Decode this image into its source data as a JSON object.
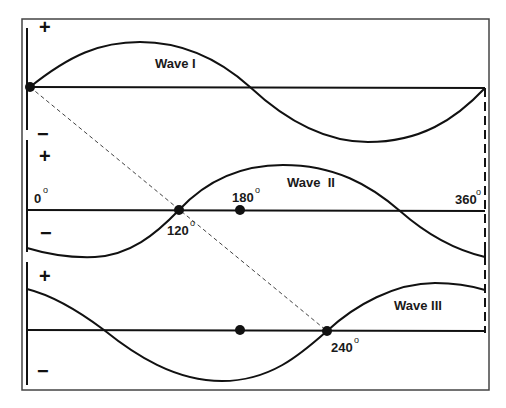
{
  "diagram": {
    "colors": {
      "line": "#111111",
      "frame": "#444444",
      "background": "#ffffff",
      "dashed": "#333333"
    },
    "waves": [
      {
        "id": "wave1",
        "label": "Wave I",
        "phase_start_deg": 0
      },
      {
        "id": "wave2",
        "label": "Wave  II",
        "phase_start_deg": 120
      },
      {
        "id": "wave3",
        "label": "Wave III",
        "phase_start_deg": 240
      }
    ],
    "signs": {
      "plus": "+",
      "minus": "−"
    },
    "degree_labels": {
      "zero": "0",
      "one_twenty": "120",
      "one_eighty": "180",
      "three_sixty": "360",
      "two_forty": "240",
      "degree_symbol": "o"
    }
  }
}
